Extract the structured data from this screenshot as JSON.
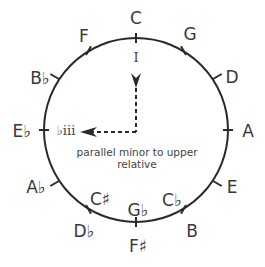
{
  "diagram": {
    "colors": {
      "line": "#2a2a2a",
      "text": "#3a3a3a"
    },
    "circle": {
      "cx": 136,
      "cy": 130,
      "r": 92
    },
    "notes": [
      {
        "label": "C",
        "x": 136,
        "y": 24
      },
      {
        "label": "G",
        "x": 188,
        "y": 40
      },
      {
        "label": "D",
        "x": 230,
        "y": 82
      },
      {
        "label": "A",
        "x": 248,
        "y": 136
      },
      {
        "label": "E",
        "x": 232,
        "y": 192
      },
      {
        "label": "B",
        "x": 190,
        "y": 236
      },
      {
        "label": "C♭",
        "x": 172,
        "y": 205
      },
      {
        "label": "G♭",
        "x": 136,
        "y": 217
      },
      {
        "label": "F♯",
        "x": 136,
        "y": 252
      },
      {
        "label": "C♯",
        "x": 100,
        "y": 205
      },
      {
        "label": "D♭",
        "x": 88,
        "y": 236
      },
      {
        "label": "A♭",
        "x": 36,
        "y": 192
      },
      {
        "label": "E♭",
        "x": 22,
        "y": 136
      },
      {
        "label": "B♭",
        "x": 40,
        "y": 82
      },
      {
        "label": "F",
        "x": 86,
        "y": 40
      }
    ],
    "roman_numerals": [
      {
        "label": "I",
        "x": 136,
        "y": 58
      },
      {
        "label": "♭iii",
        "x": 67,
        "y": 135
      }
    ],
    "arrow": {
      "description": "dashed arrow from I down then left to ♭iii"
    },
    "caption": {
      "line1": "parallel minor to upper",
      "line2": "relative"
    }
  }
}
